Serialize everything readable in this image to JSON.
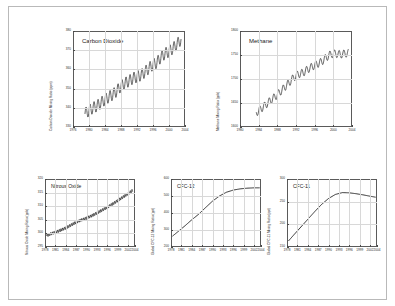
{
  "figure": {
    "background": "#ffffff",
    "border_color": "#b9b9b9",
    "line_color": "#1c1c1c",
    "grid_color": "#d8d8d8"
  },
  "chart_data": [
    {
      "type": "line",
      "title": "Carbon Dioxide",
      "xlabel": "",
      "ylabel": "Carbon Dioxide Mixing Ratio (ppm)",
      "xlim": [
        1976,
        2004
      ],
      "ylim": [
        330,
        380
      ],
      "xticks": [
        1976,
        1980,
        1984,
        1988,
        1992,
        1996,
        2000,
        2004
      ],
      "xticklabels": [
        "1976",
        "1980",
        "1984",
        "1988",
        "1992",
        "1996",
        "2000",
        "2004"
      ],
      "yticks": [
        330,
        340,
        350,
        360,
        370,
        380
      ],
      "yticklabels": [
        "330",
        "340",
        "350",
        "360",
        "370",
        "380"
      ],
      "grid": true,
      "seasonal_amplitude": 3.0,
      "seasonal_period": 1.0,
      "x": [
        1979.0,
        1980.0,
        1981.0,
        1982.0,
        1983.0,
        1984.0,
        1985.0,
        1986.0,
        1987.0,
        1988.0,
        1989.0,
        1990.0,
        1991.0,
        1992.0,
        1993.0,
        1994.0,
        1995.0,
        1996.0,
        1997.0,
        1998.0,
        1999.0,
        2000.0,
        2001.0,
        2002.0,
        2003.0
      ],
      "values": [
        337.0,
        338.6,
        340.0,
        341.0,
        342.6,
        344.3,
        345.7,
        347.0,
        348.9,
        351.3,
        352.8,
        354.0,
        355.4,
        356.2,
        357.0,
        358.7,
        360.7,
        362.5,
        363.6,
        366.5,
        368.2,
        369.4,
        371.0,
        373.1,
        375.6
      ]
    },
    {
      "type": "line",
      "title": "Methane",
      "xlabel": "",
      "ylabel": "Methane Mixing Ratio (ppb)",
      "xlim": [
        1980,
        2004
      ],
      "ylim": [
        1600,
        1800
      ],
      "xticks": [
        1980,
        1984,
        1988,
        1992,
        1996,
        2000,
        2004
      ],
      "xticklabels": [
        "1980",
        "1984",
        "1988",
        "1992",
        "1996",
        "2000",
        "2004"
      ],
      "yticks": [
        1600,
        1650,
        1700,
        1750,
        1800
      ],
      "yticklabels": [
        "1600",
        "1650",
        "1700",
        "1750",
        "1800"
      ],
      "grid": true,
      "seasonal_amplitude": 8.0,
      "seasonal_period": 1.0,
      "x": [
        1983.5,
        1984.5,
        1985.5,
        1986.5,
        1987.5,
        1988.5,
        1989.5,
        1990.5,
        1991.5,
        1992.5,
        1993.5,
        1994.5,
        1995.5,
        1996.5,
        1997.5,
        1998.5,
        1999.5,
        2000.5,
        2001.5,
        2002.5,
        2003.2
      ],
      "values": [
        1630.0,
        1638.0,
        1646.0,
        1655.0,
        1663.0,
        1672.0,
        1682.0,
        1692.0,
        1703.0,
        1710.0,
        1713.0,
        1720.0,
        1726.0,
        1731.0,
        1736.0,
        1745.0,
        1752.0,
        1753.0,
        1751.0,
        1753.0,
        1754.0
      ]
    },
    {
      "type": "line",
      "title": "Nitrous Oxide",
      "xlabel": "",
      "ylabel": "Nitrous Oxide Mixing Ratio (ppb)",
      "xlim": [
        1978,
        2004
      ],
      "ylim": [
        295,
        320
      ],
      "xticks": [
        1978,
        1981,
        1984,
        1987,
        1990,
        1993,
        1996,
        1999,
        2002,
        2004
      ],
      "xticklabels": [
        "1978",
        "1981",
        "1984",
        "1987",
        "1990",
        "1993",
        "1996",
        "1999",
        "2002",
        "2004"
      ],
      "yticks": [
        295,
        300,
        305,
        310,
        315,
        320
      ],
      "yticklabels": [
        "295",
        "300",
        "305",
        "310",
        "315",
        "320"
      ],
      "grid": true,
      "seasonal_amplitude": 0.55,
      "seasonal_period": 0.5,
      "x": [
        1978.5,
        1980.0,
        1982.0,
        1984.0,
        1986.0,
        1988.0,
        1990.0,
        1992.0,
        1994.0,
        1996.0,
        1998.0,
        2000.0,
        2002.0,
        2003.3
      ],
      "values": [
        299.2,
        300.0,
        300.9,
        302.0,
        303.4,
        304.7,
        305.6,
        306.8,
        308.2,
        309.6,
        311.2,
        312.9,
        314.6,
        315.8
      ]
    },
    {
      "type": "line",
      "title": "CFC-12",
      "xlabel": "",
      "ylabel": "Global CFC-12 Mixing Ratio (ppt)",
      "xlim": [
        1978,
        2004
      ],
      "ylim": [
        200,
        600
      ],
      "xticks": [
        1978,
        1981,
        1984,
        1987,
        1990,
        1993,
        1996,
        1999,
        2002,
        2004
      ],
      "xticklabels": [
        "1978",
        "1981",
        "1984",
        "1987",
        "1990",
        "1993",
        "1996",
        "1999",
        "2002",
        "2004"
      ],
      "yticks": [
        200,
        300,
        400,
        500,
        600
      ],
      "yticklabels": [
        "200",
        "300",
        "400",
        "500",
        "600"
      ],
      "grid": true,
      "seasonal_amplitude": 0,
      "seasonal_period": 1.0,
      "x": [
        1978.5,
        1980.0,
        1982.0,
        1984.0,
        1986.0,
        1988.0,
        1990.0,
        1992.0,
        1994.0,
        1996.0,
        1998.0,
        2000.0,
        2002.0,
        2003.5
      ],
      "values": [
        265.0,
        290.0,
        324.0,
        360.0,
        393.0,
        432.0,
        470.0,
        500.0,
        522.0,
        535.0,
        542.0,
        546.0,
        548.0,
        548.0
      ]
    },
    {
      "type": "line",
      "title": "CFC-11",
      "xlabel": "",
      "ylabel": "Global CFC-11 Mixing Ratio (ppt)",
      "xlim": [
        1978,
        2004
      ],
      "ylim": [
        150,
        300
      ],
      "xticks": [
        1978,
        1981,
        1984,
        1987,
        1990,
        1993,
        1996,
        1999,
        2002,
        2004
      ],
      "xticklabels": [
        "1978",
        "1981",
        "1984",
        "1987",
        "1990",
        "1993",
        "1996",
        "1999",
        "2002",
        "2004"
      ],
      "yticks": [
        150,
        200,
        250,
        300
      ],
      "yticklabels": [
        "150",
        "200",
        "250",
        "300"
      ],
      "grid": true,
      "seasonal_amplitude": 0,
      "seasonal_period": 1.0,
      "x": [
        1978.5,
        1980.0,
        1982.0,
        1984.0,
        1986.0,
        1988.0,
        1990.0,
        1992.0,
        1994.0,
        1996.0,
        1998.0,
        2000.0,
        2002.0,
        2003.5
      ],
      "values": [
        164.0,
        177.0,
        194.0,
        211.0,
        228.0,
        244.0,
        257.0,
        266.0,
        270.0,
        269.5,
        267.5,
        265.0,
        262.0,
        260.0
      ]
    }
  ]
}
